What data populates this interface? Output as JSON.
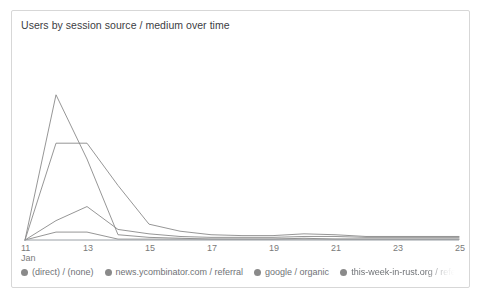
{
  "card": {
    "title": "Users by session source / medium over time"
  },
  "chart_data": {
    "type": "line",
    "title": "Users by session source / medium over time",
    "xlabel": "",
    "ylabel": "",
    "grid": false,
    "legend_position": "bottom",
    "axis_month_label": "Jan",
    "x": [
      11,
      12,
      13,
      14,
      15,
      16,
      17,
      18,
      19,
      20,
      21,
      22,
      23,
      24,
      25
    ],
    "xtick_labels": [
      "11",
      "13",
      "15",
      "17",
      "19",
      "21",
      "23",
      "25"
    ],
    "xlim": [
      11,
      25
    ],
    "ylim": [
      0,
      175
    ],
    "series": [
      {
        "name": "(direct) / (none)",
        "color": "#8a8a8a",
        "values": [
          0,
          110,
          110,
          62,
          18,
          10,
          6,
          5,
          5,
          7,
          6,
          4,
          4,
          4,
          4
        ]
      },
      {
        "name": "news.ycombinator.com / referral",
        "color": "#8a8a8a",
        "values": [
          0,
          165,
          92,
          6,
          3,
          2,
          1,
          1,
          1,
          2,
          1,
          1,
          1,
          1,
          1
        ]
      },
      {
        "name": "google / organic",
        "color": "#8a8a8a",
        "values": [
          0,
          22,
          38,
          12,
          7,
          4,
          3,
          3,
          3,
          4,
          4,
          3,
          3,
          3,
          3
        ]
      },
      {
        "name": "this-week-in-rust.org / referral",
        "color": "#8a8a8a",
        "values": [
          0,
          9,
          9,
          1,
          1,
          1,
          1,
          1,
          1,
          1,
          1,
          1,
          1,
          1,
          1
        ]
      }
    ]
  },
  "legend": {
    "items": [
      {
        "label": "(direct) / (none)",
        "truncated": false
      },
      {
        "label": "news.ycombinator.com / referral",
        "truncated": false
      },
      {
        "label": "google / organic",
        "truncated": false
      },
      {
        "label": "this-week-in-rust.org / referral",
        "truncated": true
      }
    ]
  }
}
